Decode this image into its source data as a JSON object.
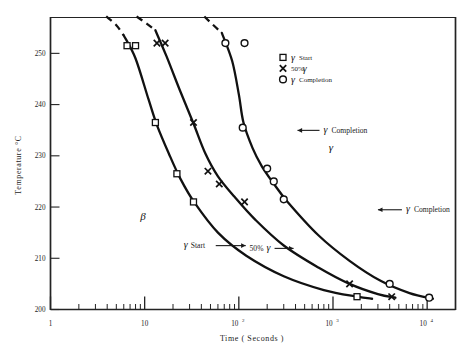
{
  "chart_data": {
    "type": "line",
    "title": "",
    "xlabel": "Time ( Seconds )",
    "ylabel": "Temperature °C",
    "xscale": "log",
    "xlim": [
      1,
      20000
    ],
    "ylim": [
      200,
      257
    ],
    "grid": false,
    "xtick_labels": [
      "1",
      "10",
      "10²",
      "10³",
      "10⁴"
    ],
    "xtick_values": [
      1,
      10,
      100,
      1000,
      10000
    ],
    "ytick_labels": [
      "200",
      "210",
      "220",
      "230",
      "240",
      "250"
    ],
    "ytick_values": [
      200,
      210,
      220,
      230,
      240,
      250
    ],
    "legend_position": "upper-right-inside",
    "legend": [
      {
        "marker": "square-open",
        "label_symbol": "γ",
        "label_text": "Start"
      },
      {
        "marker": "cross-x",
        "label_symbol": "γ",
        "label_text": "50%",
        "order": "text-first"
      },
      {
        "marker": "circle-open",
        "label_symbol": "γ",
        "label_text": "Completion"
      }
    ],
    "series": [
      {
        "name": "γ Start",
        "marker": "square-open",
        "points": [
          {
            "t": 6.5,
            "T": 251.5
          },
          {
            "t": 8.0,
            "T": 251.5
          },
          {
            "t": 13.0,
            "T": 236.5
          },
          {
            "t": 22.0,
            "T": 226.5
          },
          {
            "t": 33.0,
            "T": 221.0
          },
          {
            "t": 1800.0,
            "T": 202.5
          }
        ],
        "dashed_extension_top": {
          "t": 4.6,
          "T": 256.5
        }
      },
      {
        "name": "50% γ",
        "marker": "cross-x",
        "points": [
          {
            "t": 13.5,
            "T": 252.0
          },
          {
            "t": 16.5,
            "T": 252.0
          },
          {
            "t": 33.0,
            "T": 236.5
          },
          {
            "t": 47.0,
            "T": 227.0
          },
          {
            "t": 62.0,
            "T": 224.5
          },
          {
            "t": 115.0,
            "T": 221.0
          },
          {
            "t": 1500.0,
            "T": 205.0
          },
          {
            "t": 4200.0,
            "T": 202.5
          }
        ],
        "dashed_extension_top": {
          "t": 9.0,
          "T": 257.0
        }
      },
      {
        "name": "γ Completion",
        "marker": "circle-open",
        "points": [
          {
            "t": 72.0,
            "T": 252.0
          },
          {
            "t": 115.0,
            "T": 252.0
          },
          {
            "t": 110.0,
            "T": 235.5
          },
          {
            "t": 200.0,
            "T": 227.5
          },
          {
            "t": 235.0,
            "T": 225.0
          },
          {
            "t": 300.0,
            "T": 221.5
          },
          {
            "t": 4000.0,
            "T": 205.0
          },
          {
            "t": 10500.0,
            "T": 202.3
          }
        ],
        "dashed_extension_top": {
          "t": 46.0,
          "T": 257.0
        }
      }
    ],
    "annotations": [
      {
        "text_symbol": "β",
        "kind": "region-label",
        "t": 9.0,
        "T": 217.5
      },
      {
        "text_symbol": "γ",
        "kind": "region-label",
        "t": 900.0,
        "T": 231.0
      },
      {
        "text_symbol": "γ",
        "text": "Start",
        "kind": "arrow-right",
        "t": 26.0,
        "T": 212.0
      },
      {
        "text": "50%",
        "text_symbol": "γ",
        "kind": "arrow-right",
        "t": 130.0,
        "T": 211.5
      },
      {
        "text_symbol": "γ",
        "text": "Completion",
        "kind": "arrow-left",
        "t": 420.0,
        "T": 234.5
      },
      {
        "text_symbol": "γ",
        "text": "Completion",
        "kind": "arrow-left",
        "t": 3000.0,
        "T": 219.0
      }
    ],
    "colors": {
      "curve": "#111111",
      "marker": "#111111",
      "axis": "#232323",
      "background": "#ffffff"
    }
  }
}
